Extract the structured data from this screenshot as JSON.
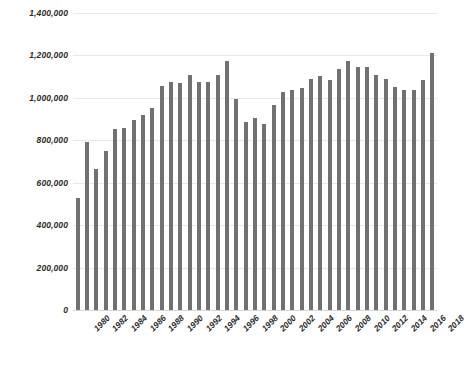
{
  "chart_data": {
    "type": "bar",
    "title": "",
    "subtitle": "",
    "xlabel": "",
    "ylabel": "",
    "ylim": [
      0,
      1400000
    ],
    "ytick_labels": [
      "1,400,000",
      "1,200,000",
      "1,000,000",
      "800,000",
      "600,000",
      "400,000",
      "200,000",
      "0"
    ],
    "ytick_values": [
      1400000,
      1200000,
      1000000,
      800000,
      600000,
      400000,
      200000,
      0
    ],
    "grid": true,
    "legend": "none",
    "bar_color": "#717171",
    "gridline_color": "#e8e8e8",
    "xtick_labels": [
      "1980",
      "1982",
      "1984",
      "1986",
      "1988",
      "1990",
      "1992",
      "1994",
      "1996",
      "1998",
      "2000",
      "2002",
      "2004",
      "2006",
      "2008",
      "2010",
      "2012",
      "2014",
      "2016",
      "2018"
    ],
    "categories": [
      "1980",
      "1981",
      "1982",
      "1983",
      "1984",
      "1985",
      "1986",
      "1987",
      "1988",
      "1989",
      "1990",
      "1991",
      "1992",
      "1993",
      "1994",
      "1995",
      "1996",
      "1997",
      "1998",
      "1999",
      "2000",
      "2001",
      "2002",
      "2003",
      "2004",
      "2005",
      "2006",
      "2007",
      "2008",
      "2009",
      "2010",
      "2011",
      "2012",
      "2013",
      "2014",
      "2015",
      "2016",
      "2017",
      "2018"
    ],
    "values": [
      530000,
      790000,
      665000,
      750000,
      855000,
      860000,
      895000,
      920000,
      950000,
      1055000,
      1075000,
      1070000,
      1110000,
      1075000,
      1075000,
      1110000,
      1175000,
      995000,
      885000,
      905000,
      875000,
      965000,
      1030000,
      1035000,
      1045000,
      1090000,
      1105000,
      1085000,
      1135000,
      1175000,
      1145000,
      1145000,
      1110000,
      1090000,
      1050000,
      1035000,
      1035000,
      1085000,
      1210000
    ]
  }
}
